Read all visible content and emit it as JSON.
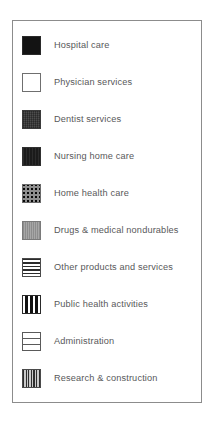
{
  "panel": {
    "border_color": "#8c8c8c",
    "background": "#ffffff"
  },
  "legend": {
    "items": [
      {
        "label": "Hospital care",
        "pattern": "solid-black",
        "pattern_class": "pat-solid-black",
        "color": "#131313",
        "top": 14
      },
      {
        "label": "Physician services",
        "pattern": "white-outline",
        "pattern_class": "pat-white",
        "color": "#ffffff",
        "top": 51
      },
      {
        "label": "Dentist services",
        "pattern": "dark-gray-crosshatch",
        "pattern_class": "pat-dark-gray",
        "color": "#4d4d4d",
        "top": 88
      },
      {
        "label": "Nursing home care",
        "pattern": "near-black",
        "pattern_class": "pat-near-black",
        "color": "#1b1b1b",
        "top": 125
      },
      {
        "label": "Home health care",
        "pattern": "dot-grid",
        "pattern_class": "pat-dot-grid",
        "color": "#8e8e8e",
        "top": 162
      },
      {
        "label": "Drugs & medical nondurables",
        "pattern": "medium-gray",
        "pattern_class": "pat-mid-gray",
        "color": "#9d9d9d",
        "top": 199
      },
      {
        "label": "Other products and services",
        "pattern": "horizontal-lines",
        "pattern_class": "pat-hlines",
        "color": "#2b2b2b",
        "top": 236
      },
      {
        "label": "Public health activities",
        "pattern": "bold-vertical-bars",
        "pattern_class": "pat-vbars-bold",
        "color": "#111111",
        "top": 273
      },
      {
        "label": "Administration",
        "pattern": "white-horizontal-bands",
        "pattern_class": "pat-hbands",
        "color": "#ffffff",
        "top": 310
      },
      {
        "label": "Research & construction",
        "pattern": "fine-vertical-lines",
        "pattern_class": "pat-vlines-fine",
        "color": "#9a9a9a",
        "top": 347
      }
    ]
  }
}
